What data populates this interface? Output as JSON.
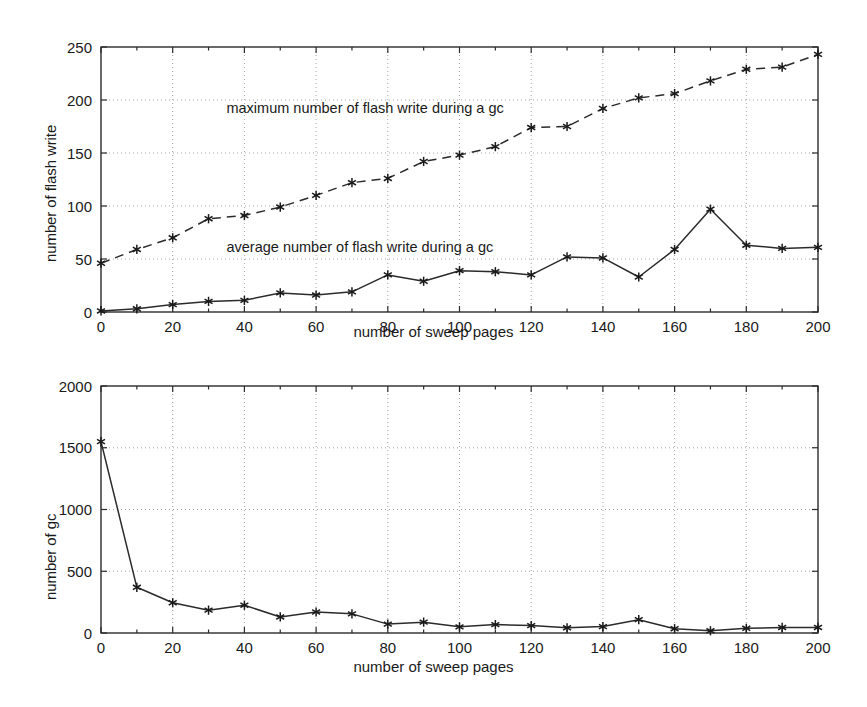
{
  "figure": {
    "background_color": "#ffffff",
    "line_color": "#2b2b2b",
    "grid_color": "#9a9a9a"
  },
  "chart_data": [
    {
      "type": "line",
      "panel": "top",
      "title": "",
      "xlabel": "number of sweep pages",
      "ylabel": "number of flash write",
      "xlim": [
        0,
        200
      ],
      "ylim": [
        0,
        250
      ],
      "xticks": [
        0,
        20,
        40,
        60,
        80,
        100,
        120,
        140,
        160,
        180,
        200
      ],
      "xticklabels": [
        "0",
        "20",
        "40",
        "60",
        "80",
        "100",
        "120",
        "140",
        "160",
        "180",
        "200"
      ],
      "yticks": [
        0,
        50,
        100,
        150,
        200,
        250
      ],
      "yticklabels": [
        "0",
        "50",
        "100",
        "150",
        "200",
        "250"
      ],
      "grid": true,
      "legend_position": "inline-annotation",
      "annotations": [
        {
          "text": "maximum number of flash write during a gc",
          "x": 35,
          "y": 188
        },
        {
          "text": "average number of flash write during a gc",
          "x": 35,
          "y": 57
        }
      ],
      "x": [
        0,
        10,
        20,
        30,
        40,
        50,
        60,
        70,
        80,
        90,
        100,
        110,
        120,
        130,
        140,
        150,
        160,
        170,
        180,
        190,
        200
      ],
      "series": [
        {
          "name": "maximum number of flash write during a gc",
          "style": "dashed",
          "marker": "asterisk",
          "values": [
            46,
            59,
            70,
            88,
            91,
            99,
            110,
            122,
            126,
            142,
            148,
            156,
            174,
            175,
            192,
            202,
            206,
            218,
            229,
            231,
            243
          ]
        },
        {
          "name": "average number of flash write during a gc",
          "style": "solid",
          "marker": "asterisk",
          "values": [
            1,
            3,
            7,
            10,
            11,
            18,
            16,
            19,
            35,
            29,
            39,
            38,
            35,
            52,
            51,
            33,
            59,
            97,
            63,
            60,
            61
          ]
        }
      ]
    },
    {
      "type": "line",
      "panel": "bottom",
      "title": "",
      "xlabel": "number of sweep pages",
      "ylabel": "number of gc",
      "xlim": [
        0,
        200
      ],
      "ylim": [
        0,
        2000
      ],
      "xticks": [
        0,
        20,
        40,
        60,
        80,
        100,
        120,
        140,
        160,
        180,
        200
      ],
      "xticklabels": [
        "0",
        "20",
        "40",
        "60",
        "80",
        "100",
        "120",
        "140",
        "160",
        "180",
        "200"
      ],
      "yticks": [
        0,
        500,
        1000,
        1500,
        2000
      ],
      "yticklabels": [
        "0",
        "500",
        "1000",
        "1500",
        "2000"
      ],
      "grid": true,
      "legend_position": "none",
      "annotations": [],
      "x": [
        0,
        10,
        20,
        30,
        40,
        50,
        60,
        70,
        80,
        90,
        100,
        110,
        120,
        130,
        140,
        150,
        160,
        170,
        180,
        190,
        200
      ],
      "series": [
        {
          "name": "number of gc",
          "style": "solid",
          "marker": "asterisk",
          "values": [
            1550,
            370,
            245,
            185,
            225,
            130,
            170,
            155,
            72,
            88,
            50,
            68,
            60,
            42,
            52,
            108,
            35,
            18,
            38,
            45,
            45
          ]
        }
      ]
    }
  ]
}
